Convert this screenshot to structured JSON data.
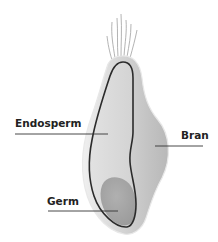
{
  "diagram": {
    "labels": {
      "endosperm": "Endosperm",
      "bran": "Bran",
      "germ": "Germ"
    },
    "colors": {
      "background": "#ffffff",
      "bran_fill": "#c9c9c9",
      "bran_edge": "#e6e6e6",
      "endosperm_fill": "#dcdcdc",
      "germ_fill": "#a6a6a6",
      "outline": "#2b2b2b",
      "leader_line": "#333333",
      "hair": "#9a9a9a",
      "label_text": "#222222"
    }
  }
}
